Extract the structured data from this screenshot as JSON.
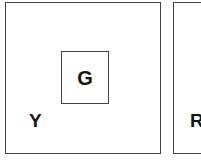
{
  "figure": {
    "background_color": "#ffffff",
    "stroke_color": "#444444",
    "text_color": "#141414",
    "panels": [
      {
        "id": "left-panel",
        "corner_label": "Y",
        "inner_box": {
          "id": "inner-box-g",
          "label": "G"
        }
      },
      {
        "id": "right-panel-clipped",
        "corner_label": "R"
      }
    ]
  },
  "labels": {
    "inner_g": "G",
    "corner_y": "Y",
    "corner_partial": "R"
  }
}
